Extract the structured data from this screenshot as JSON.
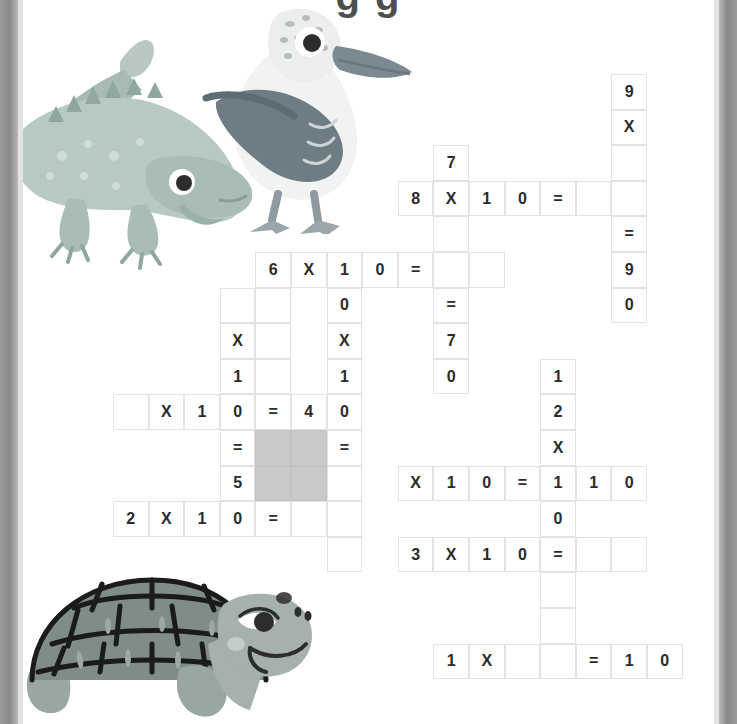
{
  "page": {
    "title_partial": "g  g",
    "background_color": "#ffffff",
    "edge_color": "#8d8d8d",
    "grid_line_color": "#e2e2e2",
    "blocked_cell_color": "#c9c9c9",
    "text_color": "#2b2b2b"
  },
  "puzzle": {
    "type": "multiplication-crossword",
    "cell_size": 35.6,
    "origin_x": 113,
    "origin_y": 74,
    "cells": [
      {
        "name": "r0c14-9",
        "col": 14,
        "row": 0,
        "text": "9"
      },
      {
        "name": "r1c14-times",
        "col": 14,
        "row": 1,
        "text": "X"
      },
      {
        "name": "r2c14-blank",
        "col": 14,
        "row": 2,
        "text": ""
      },
      {
        "name": "r2c9-7",
        "col": 9,
        "row": 2,
        "text": "7"
      },
      {
        "name": "r3c8-8",
        "col": 8,
        "row": 3,
        "text": "8"
      },
      {
        "name": "r3c9-times",
        "col": 9,
        "row": 3,
        "text": "X"
      },
      {
        "name": "r3c10-1",
        "col": 10,
        "row": 3,
        "text": "1"
      },
      {
        "name": "r3c11-0",
        "col": 11,
        "row": 3,
        "text": "0"
      },
      {
        "name": "r3c12-equals",
        "col": 12,
        "row": 3,
        "text": "="
      },
      {
        "name": "r3c13-blank",
        "col": 13,
        "row": 3,
        "text": ""
      },
      {
        "name": "r3c14-blank",
        "col": 14,
        "row": 3,
        "text": ""
      },
      {
        "name": "r4c9-blank",
        "col": 9,
        "row": 4,
        "text": ""
      },
      {
        "name": "r4c14-equals",
        "col": 14,
        "row": 4,
        "text": "="
      },
      {
        "name": "r5c4-6",
        "col": 4,
        "row": 5,
        "text": "6"
      },
      {
        "name": "r5c5-times",
        "col": 5,
        "row": 5,
        "text": "X"
      },
      {
        "name": "r5c6-1",
        "col": 6,
        "row": 5,
        "text": "1"
      },
      {
        "name": "r5c7-0",
        "col": 7,
        "row": 5,
        "text": "0"
      },
      {
        "name": "r5c8-equals",
        "col": 8,
        "row": 5,
        "text": "="
      },
      {
        "name": "r5c9-blank",
        "col": 9,
        "row": 5,
        "text": ""
      },
      {
        "name": "r5c10-blank",
        "col": 10,
        "row": 5,
        "text": ""
      },
      {
        "name": "r5c14-9",
        "col": 14,
        "row": 5,
        "text": "9"
      },
      {
        "name": "r6c3-blank",
        "col": 3,
        "row": 6,
        "text": ""
      },
      {
        "name": "r6c4-blank",
        "col": 4,
        "row": 6,
        "text": ""
      },
      {
        "name": "r6c6-0",
        "col": 6,
        "row": 6,
        "text": "0"
      },
      {
        "name": "r6c9-equals",
        "col": 9,
        "row": 6,
        "text": "="
      },
      {
        "name": "r6c14-0",
        "col": 14,
        "row": 6,
        "text": "0"
      },
      {
        "name": "r7c3-times",
        "col": 3,
        "row": 7,
        "text": "X"
      },
      {
        "name": "r7c4-blank",
        "col": 4,
        "row": 7,
        "text": ""
      },
      {
        "name": "r7c6-times",
        "col": 6,
        "row": 7,
        "text": "X"
      },
      {
        "name": "r7c9-7",
        "col": 9,
        "row": 7,
        "text": "7"
      },
      {
        "name": "r8c3-1",
        "col": 3,
        "row": 8,
        "text": "1"
      },
      {
        "name": "r8c4-blank",
        "col": 4,
        "row": 8,
        "text": ""
      },
      {
        "name": "r8c6-1",
        "col": 6,
        "row": 8,
        "text": "1"
      },
      {
        "name": "r8c9-0",
        "col": 9,
        "row": 8,
        "text": "0"
      },
      {
        "name": "r8c12-1",
        "col": 12,
        "row": 8,
        "text": "1"
      },
      {
        "name": "r9c0-blank",
        "col": 0,
        "row": 9,
        "text": ""
      },
      {
        "name": "r9c1-times",
        "col": 1,
        "row": 9,
        "text": "X"
      },
      {
        "name": "r9c2-1",
        "col": 2,
        "row": 9,
        "text": "1"
      },
      {
        "name": "r9c3-0",
        "col": 3,
        "row": 9,
        "text": "0"
      },
      {
        "name": "r9c4-equals",
        "col": 4,
        "row": 9,
        "text": "="
      },
      {
        "name": "r9c5-4",
        "col": 5,
        "row": 9,
        "text": "4"
      },
      {
        "name": "r9c6-0",
        "col": 6,
        "row": 9,
        "text": "0"
      },
      {
        "name": "r9c12-2",
        "col": 12,
        "row": 9,
        "text": "2"
      },
      {
        "name": "r10c3-equals",
        "col": 3,
        "row": 10,
        "text": "="
      },
      {
        "name": "r10c4-blocked",
        "col": 4,
        "row": 10,
        "text": "",
        "blocked": true
      },
      {
        "name": "r10c5-blocked",
        "col": 5,
        "row": 10,
        "text": "",
        "blocked": true
      },
      {
        "name": "r10c6-equals",
        "col": 6,
        "row": 10,
        "text": "="
      },
      {
        "name": "r10c12-times",
        "col": 12,
        "row": 10,
        "text": "X"
      },
      {
        "name": "r11c3-5",
        "col": 3,
        "row": 11,
        "text": "5"
      },
      {
        "name": "r11c4-blocked",
        "col": 4,
        "row": 11,
        "text": "",
        "blocked": true
      },
      {
        "name": "r11c5-blocked",
        "col": 5,
        "row": 11,
        "text": "",
        "blocked": true
      },
      {
        "name": "r11c6-blank",
        "col": 6,
        "row": 11,
        "text": ""
      },
      {
        "name": "r11c8-times",
        "col": 8,
        "row": 11,
        "text": "X"
      },
      {
        "name": "r11c9-1",
        "col": 9,
        "row": 11,
        "text": "1"
      },
      {
        "name": "r11c10-0",
        "col": 10,
        "row": 11,
        "text": "0"
      },
      {
        "name": "r11c11-equals",
        "col": 11,
        "row": 11,
        "text": "="
      },
      {
        "name": "r11c12-1",
        "col": 12,
        "row": 11,
        "text": "1"
      },
      {
        "name": "r11c13-1",
        "col": 13,
        "row": 11,
        "text": "1"
      },
      {
        "name": "r11c14-0",
        "col": 14,
        "row": 11,
        "text": "0"
      },
      {
        "name": "r12c0-2",
        "col": 0,
        "row": 12,
        "text": "2"
      },
      {
        "name": "r12c1-times",
        "col": 1,
        "row": 12,
        "text": "X"
      },
      {
        "name": "r12c2-1",
        "col": 2,
        "row": 12,
        "text": "1"
      },
      {
        "name": "r12c3-0",
        "col": 3,
        "row": 12,
        "text": "0"
      },
      {
        "name": "r12c4-equals",
        "col": 4,
        "row": 12,
        "text": "="
      },
      {
        "name": "r12c5-blank",
        "col": 5,
        "row": 12,
        "text": ""
      },
      {
        "name": "r12c6-blank",
        "col": 6,
        "row": 12,
        "text": ""
      },
      {
        "name": "r12c12-0",
        "col": 12,
        "row": 12,
        "text": "0"
      },
      {
        "name": "r13c6-blank",
        "col": 6,
        "row": 13,
        "text": ""
      },
      {
        "name": "r13c8-3",
        "col": 8,
        "row": 13,
        "text": "3"
      },
      {
        "name": "r13c9-times",
        "col": 9,
        "row": 13,
        "text": "X"
      },
      {
        "name": "r13c10-1",
        "col": 10,
        "row": 13,
        "text": "1"
      },
      {
        "name": "r13c11-0",
        "col": 11,
        "row": 13,
        "text": "0"
      },
      {
        "name": "r13c12-equals",
        "col": 12,
        "row": 13,
        "text": "="
      },
      {
        "name": "r13c13-blank",
        "col": 13,
        "row": 13,
        "text": ""
      },
      {
        "name": "r13c14-blank",
        "col": 14,
        "row": 13,
        "text": ""
      },
      {
        "name": "r14c12-blank",
        "col": 12,
        "row": 14,
        "text": ""
      },
      {
        "name": "r15c12-blank",
        "col": 12,
        "row": 15,
        "text": ""
      },
      {
        "name": "r16c9-1",
        "col": 9,
        "row": 16,
        "text": "1"
      },
      {
        "name": "r16c10-times",
        "col": 10,
        "row": 16,
        "text": "X"
      },
      {
        "name": "r16c11-blank",
        "col": 11,
        "row": 16,
        "text": ""
      },
      {
        "name": "r16c12-blank",
        "col": 12,
        "row": 16,
        "text": ""
      },
      {
        "name": "r16c13-equals",
        "col": 13,
        "row": 16,
        "text": "="
      },
      {
        "name": "r16c14-1",
        "col": 14,
        "row": 16,
        "text": "1"
      },
      {
        "name": "r16c15-0",
        "col": 15,
        "row": 16,
        "text": "0"
      }
    ]
  },
  "illustrations": [
    {
      "name": "iguana-illustration",
      "label": "iguana"
    },
    {
      "name": "booby-bird-illustration",
      "label": "blue-footed booby"
    },
    {
      "name": "tortoise-illustration",
      "label": "giant tortoise"
    }
  ]
}
